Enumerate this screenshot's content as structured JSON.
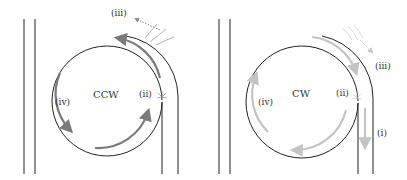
{
  "colors": {
    "wall": "#222222",
    "ccw_arrow": "#7a7a7a",
    "cw_arrow": "#c4c4c4",
    "text": "#333333"
  },
  "panels": [
    {
      "id": "left",
      "direction_label": "CCW",
      "labels": {
        "ii": "(ii)",
        "iii": "(iii)",
        "iv": "(iv)"
      }
    },
    {
      "id": "right",
      "direction_label": "CW",
      "labels": {
        "i": "(i)",
        "ii": "(ii)",
        "iii": "(iii)",
        "iv": "(iv)"
      }
    }
  ]
}
